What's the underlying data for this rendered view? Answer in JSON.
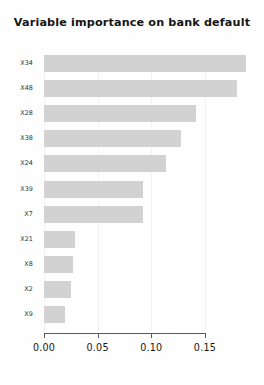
{
  "chart_data": {
    "type": "bar",
    "orientation": "horizontal",
    "title": "Variable importance on bank default",
    "xlabel": "",
    "ylabel": "",
    "categories": [
      "X34",
      "X48",
      "X28",
      "X38",
      "X24",
      "X39",
      "X7",
      "X21",
      "X8",
      "X2",
      "X9"
    ],
    "values": [
      0.188,
      0.18,
      0.142,
      0.128,
      0.114,
      0.092,
      0.092,
      0.029,
      0.027,
      0.025,
      0.02
    ],
    "series": [
      {
        "name": "Importance",
        "values": [
          0.188,
          0.18,
          0.142,
          0.128,
          0.114,
          0.092,
          0.092,
          0.029,
          0.027,
          0.025,
          0.02
        ]
      }
    ],
    "xlim": [
      0.0,
      0.2
    ],
    "xticks": [
      0.0,
      0.05,
      0.1,
      0.15
    ],
    "xtick_labels": [
      "0.00",
      "0.05",
      "0.10",
      "0.15"
    ],
    "grid": true,
    "grid_axis": "x",
    "legend": false,
    "bar_color": "#d2d2d2",
    "axis_color": "#5a5a5a",
    "grid_color": "#f2f2f2",
    "background": "#fefefe"
  }
}
